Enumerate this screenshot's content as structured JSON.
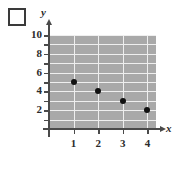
{
  "checkbox": {
    "name": "selection-checkbox",
    "checked": false,
    "label": ""
  },
  "chart_data": {
    "type": "scatter",
    "title": "",
    "xlabel": "x",
    "ylabel": "y",
    "x": [
      1,
      2,
      3,
      4
    ],
    "values": [
      5,
      4,
      3,
      2
    ],
    "points": [
      {
        "x": 1,
        "y": 5
      },
      {
        "x": 2,
        "y": 4
      },
      {
        "x": 3,
        "y": 3
      },
      {
        "x": 4,
        "y": 2
      }
    ],
    "xlim": [
      0,
      4.35
    ],
    "ylim": [
      0,
      10
    ],
    "x_ticks": [
      1,
      2,
      3,
      4
    ],
    "x_tick_labels": [
      "1",
      "2",
      "3",
      "4"
    ],
    "y_ticks": [
      1,
      2,
      3,
      4,
      5,
      6,
      7,
      8,
      9,
      10
    ],
    "y_tick_labels": [
      {
        "value": 2,
        "label": "2"
      },
      {
        "value": 4,
        "label": "4"
      },
      {
        "value": 6,
        "label": "6"
      },
      {
        "value": 8,
        "label": "8"
      },
      {
        "value": 10,
        "label": "10"
      }
    ],
    "grid": true,
    "legend": null,
    "colors": {
      "plot_background": "#a9a9a9",
      "gridline": "#efefef",
      "axis": "#4a4a4a",
      "marker": "#111111",
      "text": "#2b2b2b",
      "page_background": "#ffffff"
    }
  }
}
